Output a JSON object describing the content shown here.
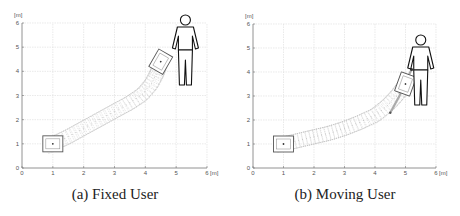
{
  "chart_data": [
    {
      "type": "scatter",
      "title": "",
      "caption": "(a) Fixed User",
      "xlabel": "[m]",
      "ylabel": "[m]",
      "xlim": [
        0,
        6
      ],
      "ylim": [
        0,
        6
      ],
      "xticks": [
        "0",
        "1",
        "2",
        "3",
        "4",
        "5",
        "6"
      ],
      "yticks": [
        "0",
        "1",
        "2",
        "3",
        "4",
        "5",
        "6"
      ],
      "grid": true,
      "robot_start": {
        "x": 1.0,
        "y": 1.0,
        "heading_deg": 0
      },
      "robot_end": {
        "x": 4.5,
        "y": 4.4,
        "heading_deg": 60
      },
      "user": {
        "x": 5.3,
        "y": 4.8,
        "state": "fixed"
      },
      "path": [
        {
          "x": 1.0,
          "y": 1.0
        },
        {
          "x": 1.5,
          "y": 1.3
        },
        {
          "x": 2.0,
          "y": 1.65
        },
        {
          "x": 2.5,
          "y": 2.0
        },
        {
          "x": 3.0,
          "y": 2.35
        },
        {
          "x": 3.5,
          "y": 2.7
        },
        {
          "x": 3.9,
          "y": 3.05
        },
        {
          "x": 4.2,
          "y": 3.5
        },
        {
          "x": 4.4,
          "y": 4.0
        },
        {
          "x": 4.5,
          "y": 4.4
        }
      ]
    },
    {
      "type": "scatter",
      "title": "",
      "caption": "(b) Moving User",
      "xlabel": "[m]",
      "ylabel": "[m]",
      "xlim": [
        0,
        6
      ],
      "ylim": [
        0,
        6
      ],
      "xticks": [
        "0",
        "1",
        "2",
        "3",
        "4",
        "5",
        "6"
      ],
      "yticks": [
        "0",
        "1",
        "2",
        "3",
        "4",
        "5",
        "6"
      ],
      "grid": true,
      "robot_start": {
        "x": 1.0,
        "y": 1.0,
        "heading_deg": 0
      },
      "robot_end": {
        "x": 5.0,
        "y": 3.5,
        "heading_deg": 70
      },
      "user": {
        "x": 5.5,
        "y": 4.0,
        "state": "moving"
      },
      "user_track": [
        {
          "x": 4.5,
          "y": 2.3
        },
        {
          "x": 4.8,
          "y": 3.0
        },
        {
          "x": 5.0,
          "y": 3.6
        },
        {
          "x": 5.2,
          "y": 4.1
        }
      ],
      "path": [
        {
          "x": 1.0,
          "y": 1.0
        },
        {
          "x": 1.5,
          "y": 1.15
        },
        {
          "x": 2.0,
          "y": 1.3
        },
        {
          "x": 2.5,
          "y": 1.45
        },
        {
          "x": 3.0,
          "y": 1.65
        },
        {
          "x": 3.5,
          "y": 1.9
        },
        {
          "x": 4.0,
          "y": 2.2
        },
        {
          "x": 4.4,
          "y": 2.6
        },
        {
          "x": 4.7,
          "y": 3.0
        },
        {
          "x": 5.0,
          "y": 3.5
        }
      ]
    }
  ]
}
